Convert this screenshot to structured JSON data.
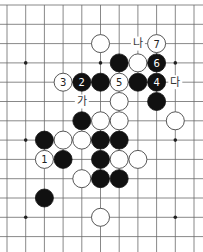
{
  "board": {
    "cols": 11,
    "rows": 13,
    "origin_x": 7,
    "origin_y": 5,
    "spacing_x": 18.7,
    "spacing_y": 19.3,
    "stone_radius": 9,
    "line_color": "#6a6a6a",
    "star_points": [
      [
        1,
        3
      ],
      [
        5,
        3
      ],
      [
        9,
        3
      ],
      [
        1,
        7
      ],
      [
        9,
        7
      ],
      [
        1,
        11
      ],
      [
        9,
        11
      ]
    ]
  },
  "stones": [
    {
      "color": "white",
      "col": 5,
      "row": 2,
      "number": ""
    },
    {
      "color": "white",
      "col": 8,
      "row": 2,
      "number": "7"
    },
    {
      "color": "black",
      "col": 6,
      "row": 3,
      "number": ""
    },
    {
      "color": "white",
      "col": 7,
      "row": 3,
      "number": ""
    },
    {
      "color": "black",
      "col": 8,
      "row": 3,
      "number": "6"
    },
    {
      "color": "white",
      "col": 3,
      "row": 4,
      "number": "3"
    },
    {
      "color": "black",
      "col": 4,
      "row": 4,
      "number": "2"
    },
    {
      "color": "black",
      "col": 5,
      "row": 4,
      "number": ""
    },
    {
      "color": "white",
      "col": 6,
      "row": 4,
      "number": "5"
    },
    {
      "color": "black",
      "col": 7,
      "row": 4,
      "number": ""
    },
    {
      "color": "black",
      "col": 8,
      "row": 4,
      "number": "4"
    },
    {
      "color": "white",
      "col": 6,
      "row": 5,
      "number": ""
    },
    {
      "color": "black",
      "col": 8,
      "row": 5,
      "number": ""
    },
    {
      "color": "black",
      "col": 4,
      "row": 6,
      "number": ""
    },
    {
      "color": "white",
      "col": 5,
      "row": 6,
      "number": ""
    },
    {
      "color": "white",
      "col": 6,
      "row": 6,
      "number": ""
    },
    {
      "color": "white",
      "col": 9,
      "row": 6,
      "number": ""
    },
    {
      "color": "black",
      "col": 2,
      "row": 7,
      "number": ""
    },
    {
      "color": "white",
      "col": 3,
      "row": 7,
      "number": ""
    },
    {
      "color": "white",
      "col": 4,
      "row": 7,
      "number": ""
    },
    {
      "color": "black",
      "col": 5,
      "row": 7,
      "number": ""
    },
    {
      "color": "black",
      "col": 6,
      "row": 7,
      "number": ""
    },
    {
      "color": "white",
      "col": 2,
      "row": 8,
      "number": "1"
    },
    {
      "color": "black",
      "col": 3,
      "row": 8,
      "number": ""
    },
    {
      "color": "black",
      "col": 5,
      "row": 8,
      "number": ""
    },
    {
      "color": "white",
      "col": 6,
      "row": 8,
      "number": ""
    },
    {
      "color": "white",
      "col": 7,
      "row": 8,
      "number": ""
    },
    {
      "color": "white",
      "col": 4,
      "row": 9,
      "number": ""
    },
    {
      "color": "black",
      "col": 5,
      "row": 9,
      "number": ""
    },
    {
      "color": "black",
      "col": 6,
      "row": 9,
      "number": ""
    },
    {
      "color": "black",
      "col": 2,
      "row": 10,
      "number": ""
    },
    {
      "color": "white",
      "col": 5,
      "row": 11,
      "number": ""
    }
  ],
  "labels": [
    {
      "text": "가",
      "col": 4,
      "row": 5
    },
    {
      "text": "나",
      "col": 7,
      "row": 2
    },
    {
      "text": "다",
      "col": 9,
      "row": 4
    }
  ]
}
